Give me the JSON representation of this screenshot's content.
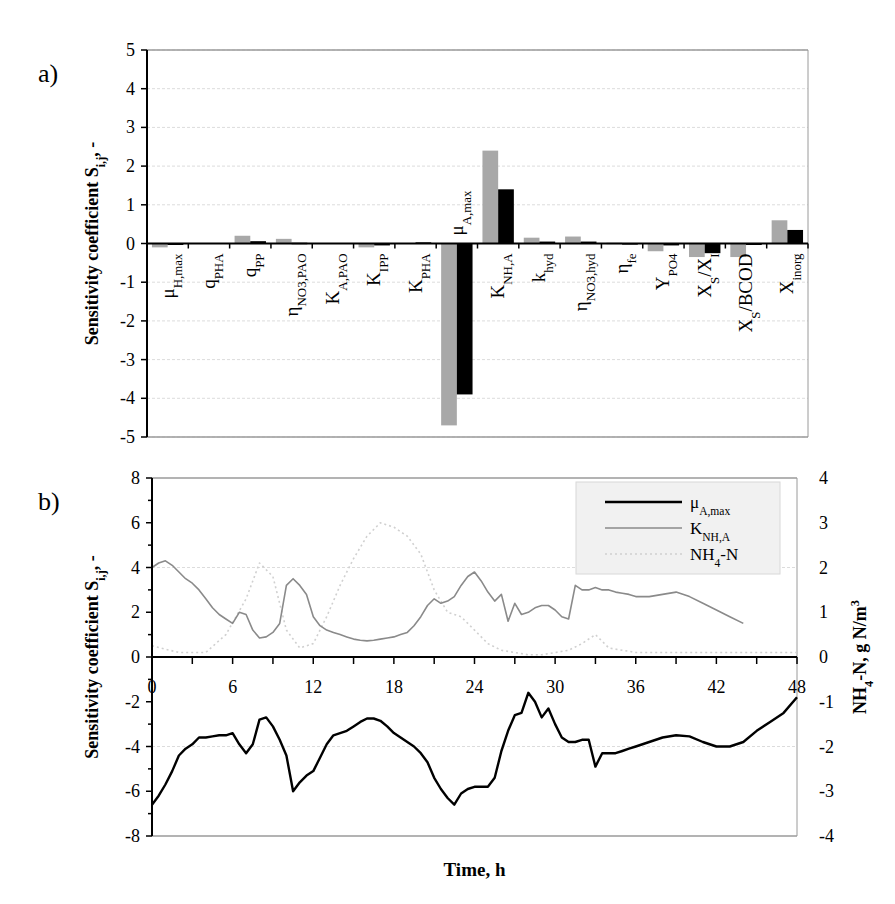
{
  "chart_data": [
    {
      "panel_label": "a)",
      "type": "bar",
      "title": "",
      "xlabel": "",
      "ylabel": "Sensitivity coefficient S",
      "ylabel_sub": "i,j",
      "ylabel_suffix": ", -",
      "ylim": [
        -5,
        5
      ],
      "yticks": [
        5,
        4,
        3,
        2,
        1,
        0,
        -1,
        -2,
        -3,
        -4,
        -5
      ],
      "grid": true,
      "legend": null,
      "categories": [
        {
          "main": "μ",
          "sub": "H,max"
        },
        {
          "main": "q",
          "sub": "PHA"
        },
        {
          "main": "q",
          "sub": "PP"
        },
        {
          "main": "η",
          "sub": "NO3,PAO"
        },
        {
          "main": "K",
          "sub": "A,PAO"
        },
        {
          "main": "K",
          "sub": "IPP"
        },
        {
          "main": "K",
          "sub": "PHA"
        },
        {
          "main": "μ",
          "sub": "A,max"
        },
        {
          "main": "K",
          "sub": "NH,A"
        },
        {
          "main": "k",
          "sub": "hyd"
        },
        {
          "main": "η",
          "sub": "NO3,hyd"
        },
        {
          "main": "η",
          "sub": "fe"
        },
        {
          "main": "Y",
          "sub": "PO4"
        },
        {
          "main": "X",
          "sub": "S",
          "tail": "/X",
          "tail_sub": "I"
        },
        {
          "main": "X",
          "sub": "S",
          "tail": "/BCOD"
        },
        {
          "main": "X",
          "sub": "inorg"
        }
      ],
      "series": [
        {
          "name": "series 1 (gray)",
          "color": "#a8a8a8",
          "values": [
            -0.1,
            0.0,
            0.2,
            0.12,
            0.0,
            -0.1,
            0.0,
            -4.7,
            2.4,
            0.15,
            0.18,
            0.02,
            -0.2,
            -0.35,
            -0.35,
            0.6
          ]
        },
        {
          "name": "series 2 (black)",
          "color": "#000000",
          "values": [
            -0.02,
            0.0,
            0.06,
            0.02,
            0.0,
            -0.05,
            0.03,
            -3.9,
            1.4,
            0.05,
            0.05,
            0.01,
            -0.05,
            -0.25,
            -0.02,
            0.35
          ]
        }
      ]
    },
    {
      "panel_label": "b)",
      "type": "line",
      "title": "",
      "xlabel": "Time, h",
      "ylabel": "Sensitivity coefficient S",
      "ylabel_sub": "i,j",
      "ylabel_suffix": ", -",
      "y2label": "NH",
      "y2label_sub": "4",
      "y2label_tail": "-N, g N/m",
      "y2label_sup": "3",
      "xlim": [
        0,
        48
      ],
      "xticks": [
        0,
        6,
        12,
        18,
        24,
        30,
        36,
        42,
        48
      ],
      "ylim": [
        -8,
        8
      ],
      "yticks": [
        8,
        6,
        4,
        2,
        0,
        -2,
        -4,
        -6,
        -8
      ],
      "y2lim": [
        -4,
        4
      ],
      "y2ticks": [
        4,
        3,
        2,
        1,
        0,
        -1,
        -2,
        -3,
        -4
      ],
      "grid": true,
      "legend": {
        "position": "upper right",
        "entries": [
          {
            "main": "μ",
            "sub": "A,max",
            "color": "#000000",
            "style": "solid-thick"
          },
          {
            "main": "K",
            "sub": "NH,A",
            "color": "#8a8a8a",
            "style": "solid"
          },
          {
            "main": "NH",
            "sub": "4",
            "tail": "-N",
            "color": "#d0d0d0",
            "style": "dotted"
          }
        ]
      },
      "series": [
        {
          "name": "μA,max",
          "axis": "left",
          "color": "#000000",
          "x": [
            0,
            0.5,
            1,
            1.5,
            2,
            2.5,
            3,
            3.5,
            4,
            4.5,
            5,
            5.5,
            6,
            6.5,
            7,
            7.5,
            8,
            8.5,
            9,
            9.5,
            10,
            10.5,
            11,
            11.5,
            12,
            12.5,
            13,
            13.5,
            14,
            14.5,
            15,
            15.5,
            16,
            16.5,
            17,
            17.5,
            18,
            18.5,
            19,
            19.5,
            20,
            20.5,
            21,
            21.5,
            22,
            22.5,
            23,
            23.5,
            24,
            24.5,
            25,
            25.5,
            26,
            26.5,
            27,
            27.5,
            28,
            28.5,
            29,
            29.5,
            30,
            30.5,
            31,
            31.5,
            32,
            32.5,
            33,
            33.5,
            34,
            34.5,
            35,
            35.5,
            36,
            37,
            38,
            39,
            40,
            41,
            42,
            43,
            44,
            45,
            46,
            47,
            48
          ],
          "y": [
            -6.6,
            -6.2,
            -5.7,
            -5.1,
            -4.4,
            -4.1,
            -3.9,
            -3.6,
            -3.6,
            -3.55,
            -3.5,
            -3.5,
            -3.4,
            -3.9,
            -4.3,
            -3.9,
            -2.8,
            -2.7,
            -3.1,
            -3.7,
            -4.4,
            -6.0,
            -5.6,
            -5.3,
            -5.1,
            -4.5,
            -3.9,
            -3.5,
            -3.4,
            -3.3,
            -3.1,
            -2.9,
            -2.75,
            -2.75,
            -2.85,
            -3.1,
            -3.4,
            -3.6,
            -3.8,
            -4.0,
            -4.3,
            -4.7,
            -5.4,
            -5.9,
            -6.3,
            -6.6,
            -6.1,
            -5.9,
            -5.8,
            -5.8,
            -5.8,
            -5.4,
            -4.2,
            -3.3,
            -2.6,
            -2.5,
            -1.6,
            -2.0,
            -2.7,
            -2.3,
            -3.0,
            -3.6,
            -3.8,
            -3.8,
            -3.7,
            -3.7,
            -4.9,
            -4.3,
            -4.3,
            -4.3,
            -4.2,
            -4.1,
            -4.0,
            -3.8,
            -3.6,
            -3.5,
            -3.55,
            -3.8,
            -4.0,
            -4.0,
            -3.8,
            -3.3,
            -2.9,
            -2.5,
            -1.8
          ],
          "note": "sampled approximately from the plotted curve"
        },
        {
          "name": "KNH,A",
          "axis": "left",
          "color": "#8a8a8a",
          "x": [
            0,
            0.5,
            1,
            1.5,
            2,
            2.5,
            3,
            3.5,
            4,
            4.5,
            5,
            5.5,
            6,
            6.5,
            7,
            7.5,
            8,
            8.5,
            9,
            9.5,
            10,
            10.5,
            11,
            11.5,
            12,
            12.5,
            13,
            13.5,
            14,
            14.5,
            15,
            15.5,
            16,
            16.5,
            17,
            17.5,
            18,
            18.5,
            19,
            19.5,
            20,
            20.5,
            21,
            21.5,
            22,
            22.5,
            23,
            23.5,
            24,
            24.5,
            25,
            25.5,
            26,
            26.5,
            27,
            27.5,
            28,
            28.5,
            29,
            29.5,
            30,
            30.5,
            31,
            31.5,
            32,
            32.5,
            33,
            33.5,
            34,
            34.5,
            35,
            35.5,
            36,
            37,
            38,
            39,
            40,
            41,
            42,
            43,
            44,
            45,
            46,
            47,
            48
          ],
          "y": [
            4.0,
            4.2,
            4.3,
            4.1,
            3.8,
            3.5,
            3.3,
            3.0,
            2.6,
            2.2,
            1.9,
            1.7,
            1.5,
            2.0,
            1.9,
            1.2,
            0.85,
            0.9,
            1.1,
            1.5,
            3.2,
            3.5,
            3.2,
            2.8,
            1.8,
            1.4,
            1.2,
            1.1,
            1.0,
            0.9,
            0.8,
            0.75,
            0.72,
            0.75,
            0.8,
            0.85,
            0.9,
            1.0,
            1.1,
            1.4,
            1.8,
            2.3,
            2.6,
            2.4,
            2.5,
            2.7,
            3.2,
            3.6,
            3.8,
            3.4,
            2.9,
            2.5,
            2.8,
            1.6,
            2.4,
            1.9,
            2.0,
            2.2,
            2.3,
            2.3,
            2.1,
            1.8,
            1.7,
            3.2,
            3.0,
            3.0,
            3.1,
            3.0,
            3.0,
            2.9,
            2.85,
            2.8,
            2.7,
            2.7,
            2.8,
            2.9,
            2.7,
            2.4,
            2.1,
            1.8,
            1.5
          ],
          "note": "sampled approximately from the plotted curve"
        },
        {
          "name": "NH4-N",
          "axis": "right",
          "color": "#d0d0d0",
          "x": [
            0,
            2,
            4,
            5.5,
            7,
            8,
            9,
            10,
            11,
            12,
            13,
            14,
            15,
            16,
            17,
            18,
            19,
            20,
            21,
            22,
            23,
            24,
            25,
            26,
            27,
            28,
            29,
            30,
            31,
            32,
            33,
            34,
            36,
            38,
            40,
            42,
            44,
            46,
            48
          ],
          "y": [
            0.25,
            0.1,
            0.1,
            0.5,
            1.3,
            2.1,
            1.8,
            0.6,
            0.2,
            0.3,
            0.9,
            1.6,
            2.2,
            2.7,
            3.0,
            2.9,
            2.7,
            2.3,
            1.5,
            1.0,
            0.9,
            0.6,
            0.3,
            0.15,
            0.1,
            0.05,
            0.05,
            0.1,
            0.15,
            0.3,
            0.5,
            0.2,
            0.1,
            0.1,
            0.1,
            0.1,
            0.1,
            0.1,
            0.1
          ],
          "note": "faint dotted curve, values approximate"
        }
      ]
    }
  ]
}
